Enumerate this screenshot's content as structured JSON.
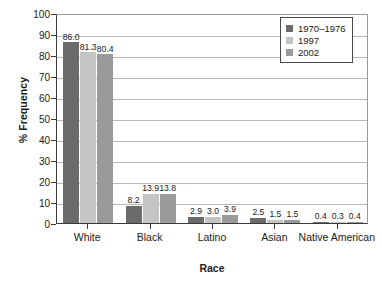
{
  "chart_data": {
    "type": "bar",
    "title": "",
    "xlabel": "Race",
    "ylabel": "% Frequency",
    "categories": [
      "White",
      "Black",
      "Latino",
      "Asian",
      "Native American"
    ],
    "series": [
      {
        "name": "1970–1976",
        "color": "#6b6b6b",
        "values": [
          86.0,
          8.2,
          2.9,
          2.5,
          0.4
        ]
      },
      {
        "name": "1997",
        "color": "#c4c4c4",
        "values": [
          81.3,
          13.9,
          3.0,
          1.5,
          0.3
        ]
      },
      {
        "name": "2002",
        "color": "#9a9a9a",
        "values": [
          80.4,
          13.8,
          3.9,
          1.5,
          0.4
        ]
      }
    ],
    "value_labels": [
      [
        "86.0",
        "81.3",
        "80.4"
      ],
      [
        "8.2",
        "13.9",
        "13.8"
      ],
      [
        "2.9",
        "3.0",
        "3.9"
      ],
      [
        "2.5",
        "1.5",
        "1.5"
      ],
      [
        "0.4",
        "0.3",
        "0.4"
      ]
    ],
    "ylim": [
      0,
      100
    ],
    "yticks": [
      0,
      10,
      20,
      30,
      40,
      50,
      60,
      70,
      80,
      90,
      100
    ],
    "ytick_labels": [
      "0",
      "10",
      "20",
      "30",
      "40",
      "50",
      "60",
      "70",
      "80",
      "90",
      "100"
    ],
    "grid": {
      "horizontal": true,
      "vertical": false
    },
    "legend": {
      "position": "top-right",
      "entries": [
        "1970–1976",
        "1997",
        "2002"
      ]
    },
    "bar_labels_shown": true
  }
}
